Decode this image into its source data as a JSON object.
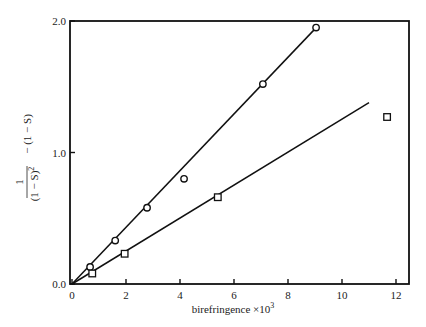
{
  "chart_data": {
    "type": "scatter",
    "title": "",
    "xlabel": "birefringence ×10³",
    "ylabel": "1/(1−S)² − (1−S)",
    "xlim": [
      0,
      12.5
    ],
    "ylim": [
      0,
      2.0
    ],
    "grid": false,
    "legend": null,
    "x_ticks": [
      0,
      2,
      4,
      6,
      8,
      10,
      12
    ],
    "x_tick_labels": [
      "0",
      "2",
      "4",
      "6",
      "8",
      "10",
      "12"
    ],
    "y_ticks": [
      0,
      1.0,
      2.0
    ],
    "y_tick_labels": [
      "0.0",
      "1.0",
      "2.0"
    ],
    "series": [
      {
        "name": "circles",
        "marker": "circle",
        "x": [
          0.67,
          1.6,
          2.78,
          4.15,
          7.07,
          9.04
        ],
        "y": [
          0.13,
          0.33,
          0.58,
          0.8,
          1.52,
          1.95
        ],
        "fit_line": {
          "x": [
            0,
            9.0
          ],
          "y": [
            0,
            1.94
          ]
        }
      },
      {
        "name": "squares",
        "marker": "square",
        "x": [
          0.75,
          1.95,
          5.4,
          11.67
        ],
        "y": [
          0.08,
          0.23,
          0.66,
          1.27
        ],
        "fit_line": {
          "x": [
            0,
            11.0
          ],
          "y": [
            0,
            1.38
          ]
        }
      }
    ]
  },
  "labels": {
    "xlabel_text": "birefringence ×10",
    "xlabel_sup": "3",
    "ylabel_num": "1",
    "ylabel_den": "(1 − S)",
    "ylabel_den_sup": "2",
    "ylabel_rest": "− (1 − S)"
  }
}
